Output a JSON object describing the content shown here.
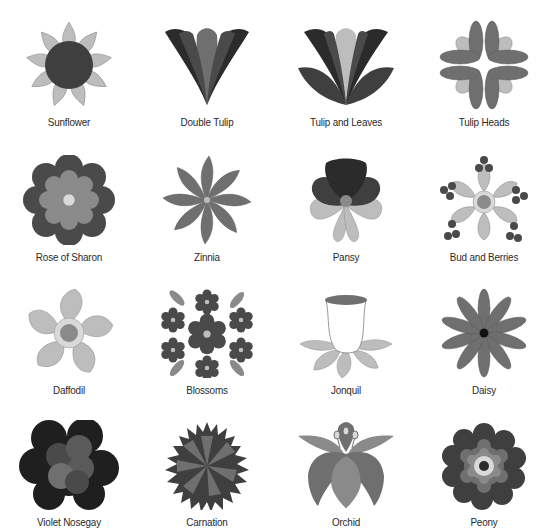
{
  "colors": {
    "dark": "#3f3f3f",
    "darker": "#2b2b2b",
    "mid": "#6f6f6f",
    "midlight": "#8a8a8a",
    "light": "#bdbdbd",
    "lighter": "#d9d9d9",
    "black": "#111111"
  },
  "flowers": [
    {
      "name": "Sunflower"
    },
    {
      "name": "Double Tulip"
    },
    {
      "name": "Tulip and Leaves"
    },
    {
      "name": "Tulip Heads"
    },
    {
      "name": "Rose of Sharon"
    },
    {
      "name": "Zinnia"
    },
    {
      "name": "Pansy"
    },
    {
      "name": "Bud and Berries"
    },
    {
      "name": "Daffodil"
    },
    {
      "name": "Blossoms"
    },
    {
      "name": "Jonquil"
    },
    {
      "name": "Daisy"
    },
    {
      "name": "Violet Nosegay"
    },
    {
      "name": "Carnation"
    },
    {
      "name": "Orchid"
    },
    {
      "name": "Peony"
    }
  ]
}
